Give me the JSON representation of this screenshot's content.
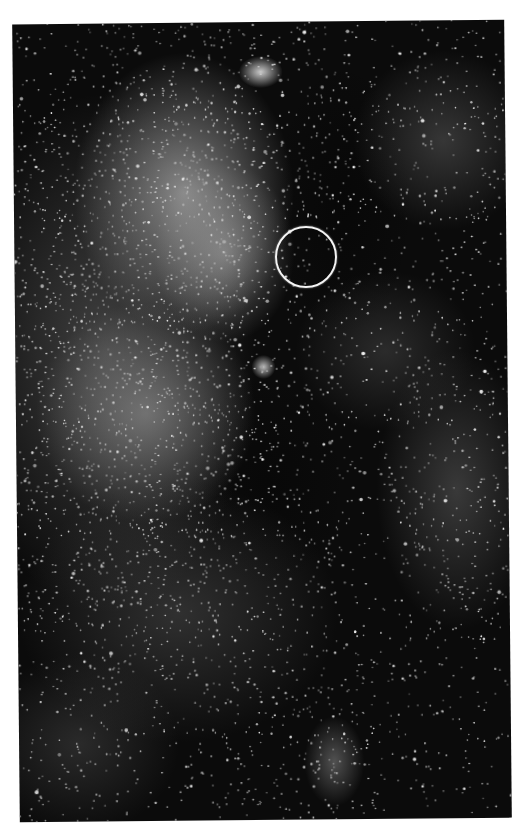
{
  "image": {
    "subject": "Milky Way star field",
    "style": "grayscale astrophotograph",
    "background_color": "#ffffff",
    "sky_color": "#0b0b0b",
    "bounds": {
      "left": 16,
      "top": 22,
      "width": 492,
      "height": 798
    }
  },
  "annotations": [
    {
      "type": "circle",
      "label": "highlighted-region",
      "center_x": 306,
      "center_y": 257,
      "radius": 31,
      "color": "#f4f4f4"
    }
  ],
  "features": [
    {
      "name": "bright-nebula-top",
      "x": 262,
      "y": 72
    },
    {
      "name": "bright-star-cluster-mid",
      "x": 262,
      "y": 365
    },
    {
      "name": "star-cloud-bottom",
      "x": 330,
      "y": 760
    }
  ]
}
